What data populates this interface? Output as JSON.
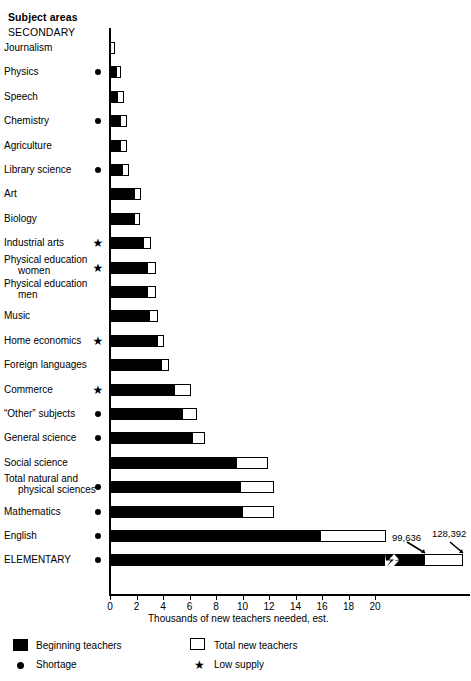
{
  "header": {
    "subject_areas_label": "Subject areas",
    "section_secondary": "SECONDARY"
  },
  "axis": {
    "xlabel": "Thousands of new teachers needed, est.",
    "ticks": [
      "0",
      "2",
      "4",
      "6",
      "8",
      "10",
      "12",
      "14",
      "16",
      "18",
      "20"
    ]
  },
  "legend": {
    "beginning_teachers": "Beginning teachers",
    "total_new_teachers": "Total new teachers",
    "shortage": "Shortage",
    "low_supply": "Low supply",
    "swatch_black": "#000000",
    "swatch_white": "#ffffff"
  },
  "callouts": {
    "elementary_beginning": "99,636",
    "elementary_total": "128,392"
  },
  "chart_data": {
    "type": "bar",
    "orientation": "horizontal",
    "title": "",
    "xlabel": "Thousands of new teachers needed, est.",
    "ylabel": "Subject areas",
    "xlim": [
      0,
      20
    ],
    "xticks": [
      0,
      2,
      4,
      6,
      8,
      10,
      12,
      14,
      16,
      18,
      20
    ],
    "grid": false,
    "legend_position": "bottom",
    "series": [
      {
        "name": "Beginning teachers",
        "color": "#000000"
      },
      {
        "name": "Total new teachers",
        "color": "#ffffff"
      }
    ],
    "markers": {
      "dot": "Shortage",
      "star": "Low supply"
    },
    "categories": [
      {
        "label": "Journalism",
        "label_line2": "",
        "marker": "",
        "beginning": 0.0,
        "total": 0.4
      },
      {
        "label": "Physics",
        "label_line2": "",
        "marker": "dot",
        "beginning": 0.5,
        "total": 0.85
      },
      {
        "label": "Speech",
        "label_line2": "",
        "marker": "",
        "beginning": 0.6,
        "total": 1.05
      },
      {
        "label": "Chemistry",
        "label_line2": "",
        "marker": "dot",
        "beginning": 0.85,
        "total": 1.3
      },
      {
        "label": "Agriculture",
        "label_line2": "",
        "marker": "",
        "beginning": 0.85,
        "total": 1.3
      },
      {
        "label": "Library science",
        "label_line2": "",
        "marker": "dot",
        "beginning": 0.95,
        "total": 1.4
      },
      {
        "label": "Art",
        "label_line2": "",
        "marker": "",
        "beginning": 1.9,
        "total": 2.35
      },
      {
        "label": "Biology",
        "label_line2": "",
        "marker": "",
        "beginning": 1.9,
        "total": 2.3
      },
      {
        "label": "Industrial arts",
        "label_line2": "",
        "marker": "star",
        "beginning": 2.55,
        "total": 3.1
      },
      {
        "label": "Physical education",
        "label_line2": "women",
        "marker": "star",
        "beginning": 2.9,
        "total": 3.5
      },
      {
        "label": "Physical education",
        "label_line2": "men",
        "marker": "",
        "beginning": 2.9,
        "total": 3.5
      },
      {
        "label": "Music",
        "label_line2": "",
        "marker": "",
        "beginning": 3.0,
        "total": 3.6
      },
      {
        "label": "Home economics",
        "label_line2": "",
        "marker": "star",
        "beginning": 3.6,
        "total": 4.1
      },
      {
        "label": "Foreign languages",
        "label_line2": "",
        "marker": "",
        "beginning": 3.9,
        "total": 4.45
      },
      {
        "label": "Commerce",
        "label_line2": "",
        "marker": "star",
        "beginning": 4.9,
        "total": 6.1
      },
      {
        "label": "“Other” subjects",
        "label_line2": "",
        "marker": "dot",
        "beginning": 5.5,
        "total": 6.6
      },
      {
        "label": "General science",
        "label_line2": "",
        "marker": "dot",
        "beginning": 6.3,
        "total": 7.2
      },
      {
        "label": "Social science",
        "label_line2": "",
        "marker": "",
        "beginning": 9.6,
        "total": 11.9
      },
      {
        "label": "Total natural and",
        "label_line2": "physical sciences",
        "marker": "dot",
        "beginning": 9.9,
        "total": 12.4
      },
      {
        "label": "Mathematics",
        "label_line2": "",
        "marker": "dot",
        "beginning": 10.0,
        "total": 12.4
      },
      {
        "label": "English",
        "label_line2": "",
        "marker": "dot",
        "beginning": 15.9,
        "total": 20.8
      },
      {
        "label": "ELEMENTARY",
        "label_line2": "",
        "marker": "dot",
        "beginning": 99.636,
        "total": 128.392,
        "axis_break": true,
        "beginning_label": "99,636",
        "total_label": "128,392"
      }
    ]
  }
}
